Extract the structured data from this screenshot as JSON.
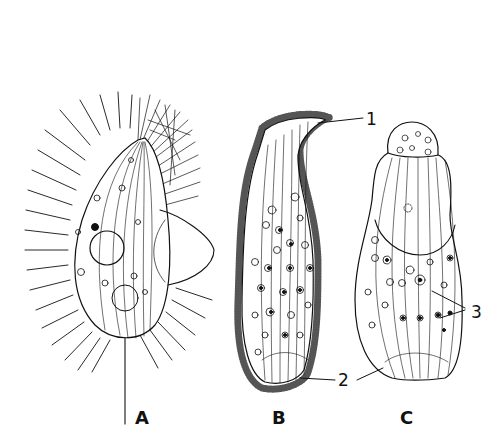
{
  "figure": {
    "panels": [
      {
        "id": "A",
        "label": "A"
      },
      {
        "id": "B",
        "label": "B"
      },
      {
        "id": "C",
        "label": "C"
      }
    ],
    "callouts": [
      {
        "id": "1",
        "label": "1"
      },
      {
        "id": "2",
        "label": "2"
      },
      {
        "id": "3",
        "label": "3"
      }
    ],
    "colors": {
      "ink": "#111111",
      "background": "#ffffff"
    }
  }
}
